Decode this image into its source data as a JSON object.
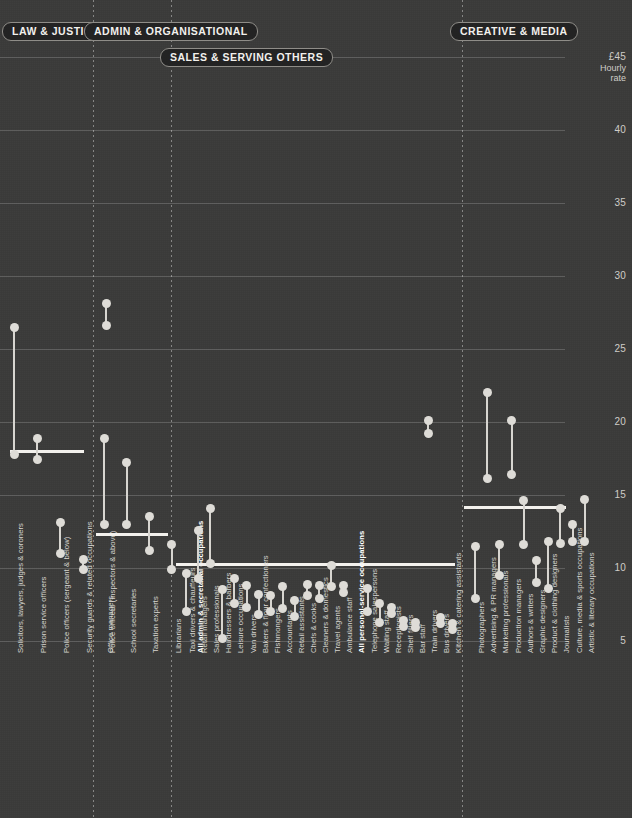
{
  "axis": {
    "top_label": "£45",
    "caption_line1": "Hourly",
    "caption_line2": "rate",
    "ticks": [
      "40",
      "35",
      "30",
      "25",
      "20",
      "15",
      "10",
      "5"
    ],
    "tick_values": [
      40,
      35,
      30,
      25,
      20,
      15,
      10,
      5
    ],
    "ymin": 3.0,
    "ymax": 45.0
  },
  "groups": [
    {
      "id": "law",
      "label": "LAW & JUSTICE"
    },
    {
      "id": "admin",
      "label": "ADMIN & ORGANISATIONAL"
    },
    {
      "id": "sales",
      "label": "SALES & SERVING OTHERS"
    },
    {
      "id": "creative",
      "label": "CREATIVE & MEDIA"
    }
  ],
  "chart_data": {
    "type": "scatter",
    "subtype": "dumbbell",
    "title": "",
    "xlabel": "",
    "ylabel": "Hourly rate",
    "ylim": [
      3,
      45
    ],
    "grid": true,
    "legend": "",
    "note": "Each occupation is a pair of points (two values) joined by a vertical stem; thick horizontal rules are group averages.",
    "series": [
      {
        "name": "upper value",
        "color": "#dedcd7"
      },
      {
        "name": "lower value",
        "color": "#dedcd7"
      }
    ],
    "groups": [
      {
        "group": "LAW & JUSTICE",
        "average": 18.0,
        "average_label": "",
        "items": [
          {
            "label": "Solicitors, lawyers, judges & coroners",
            "high": 26.5,
            "low": 17.8
          },
          {
            "label": "Prison service officers",
            "high": 18.9,
            "low": 17.4
          },
          {
            "label": "Police officers (sergeant & below)",
            "high": 13.1,
            "low": 11.0
          },
          {
            "label": "Security guards & related occupations",
            "high": 10.6,
            "low": 9.9
          },
          {
            "label": "Police officers (inspectors & above)",
            "high": 28.1,
            "low": 26.6
          }
        ]
      },
      {
        "group": "ADMIN & ORGANISATIONAL",
        "average": 12.3,
        "average_label": "",
        "items": [
          {
            "label": "Office managers",
            "high": 18.9,
            "low": 13.0
          },
          {
            "label": "School secretaries",
            "high": 17.2,
            "low": 13.0
          },
          {
            "label": "Taxation experts",
            "high": 13.5,
            "low": 11.2
          },
          {
            "label": "Librarians",
            "high": 11.6,
            "low": 9.9
          },
          {
            "label": "All admin & secretarial occupations",
            "bold": true,
            "high": null,
            "low": null
          }
        ]
      },
      {
        "group": "SALES & SERVING OTHERS",
        "average": 10.3,
        "average_label": "",
        "items": [
          {
            "label": "Taxi drivers & chauffeurs",
            "high": 9.6,
            "low": 7.0
          },
          {
            "label": "Retail managers",
            "high": 12.6,
            "low": 9.3
          },
          {
            "label": "Sales professionals",
            "high": 14.1,
            "low": 10.3
          },
          {
            "label": "Hairdressers & barbers",
            "high": 8.5,
            "low": 5.2
          },
          {
            "label": "Leisure occupations",
            "high": 9.3,
            "low": 7.6
          },
          {
            "label": "Van drivers",
            "high": 8.8,
            "low": 7.3
          },
          {
            "label": "Bakers & flour confectioners",
            "high": 8.2,
            "low": 6.8
          },
          {
            "label": "Fishmongers",
            "high": 8.1,
            "low": 7.0
          },
          {
            "label": "Accountants",
            "high": 8.7,
            "low": 7.2
          },
          {
            "label": "Retail assistants",
            "high": 7.8,
            "low": 6.7
          },
          {
            "label": "Chefs & cooks",
            "high": 8.9,
            "low": 8.1
          },
          {
            "label": "Cleaners & domestics",
            "high": 8.8,
            "low": 7.9
          },
          {
            "label": "Travel agents",
            "high": 10.2,
            "low": 8.7
          },
          {
            "label": "Ambulance staff",
            "high": 8.8,
            "low": 8.3
          },
          {
            "label": "All personal-service occupations",
            "bold": true,
            "high": null,
            "low": null
          },
          {
            "label": "Telephone salespersons",
            "high": 8.6,
            "low": 7.0
          },
          {
            "label": "Waiting staff",
            "high": 7.6,
            "low": 6.3
          },
          {
            "label": "Receptionists",
            "high": 7.3,
            "low": 6.9
          },
          {
            "label": "Shelf fillers",
            "high": 6.4,
            "low": 6.0
          },
          {
            "label": "Bar staff",
            "high": 6.3,
            "low": 5.9
          },
          {
            "label": "Train drivers",
            "high": 20.1,
            "low": 19.2
          },
          {
            "label": "Bus drivers",
            "high": 6.6,
            "low": 6.2
          },
          {
            "label": "Kitchen & catering assistants",
            "high": 6.2,
            "low": 5.8
          }
        ]
      },
      {
        "group": "CREATIVE & MEDIA",
        "average": 14.2,
        "average_label": "",
        "items": [
          {
            "label": "Photographers",
            "high": 11.5,
            "low": 7.9
          },
          {
            "label": "Advertising & PR managers",
            "high": 22.0,
            "low": 16.1
          },
          {
            "label": "Marketing professionals",
            "high": 11.6,
            "low": 9.5
          },
          {
            "label": "Production managers",
            "high": 20.1,
            "low": 16.4
          },
          {
            "label": "Authors & writers",
            "high": 14.6,
            "low": 11.6
          },
          {
            "label": "Graphic designers",
            "high": 10.5,
            "low": 9.0
          },
          {
            "label": "Product & clothing designers",
            "high": 11.8,
            "low": 8.6
          },
          {
            "label": "Journalists",
            "high": 14.1,
            "low": 11.7
          },
          {
            "label": "Culture, media & sports occupations",
            "high": 13.0,
            "low": 11.8
          },
          {
            "label": "Artistic & literary occupations",
            "high": 14.7,
            "low": 11.8
          }
        ]
      }
    ]
  }
}
